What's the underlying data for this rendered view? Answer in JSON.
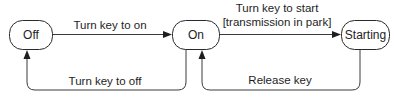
{
  "diagram": {
    "type": "state-machine",
    "states": [
      {
        "id": "off",
        "label": "Off"
      },
      {
        "id": "on",
        "label": "On"
      },
      {
        "id": "starting",
        "label": "Starting"
      }
    ],
    "transitions": [
      {
        "from": "off",
        "to": "on",
        "label": "Turn key to on"
      },
      {
        "from": "on",
        "to": "starting",
        "label_line1": "Turn key to start",
        "label_line2": "[transmission in park]"
      },
      {
        "from": "on",
        "to": "off",
        "label": "Turn key to off"
      },
      {
        "from": "starting",
        "to": "on",
        "label": "Release key"
      }
    ]
  },
  "colors": {
    "stroke": "#2a2a2a",
    "text": "#1e1e1e",
    "background": "#ffffff"
  }
}
